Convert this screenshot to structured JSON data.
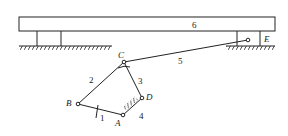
{
  "diagram": {
    "type": "planar linkage mechanism",
    "links": {
      "l1": "1",
      "l2": "2",
      "l3": "3",
      "l4": "4",
      "l5": "5",
      "l6": "6"
    },
    "joints": {
      "A": "A",
      "B": "B",
      "C": "C",
      "D": "D",
      "E": "E"
    },
    "colors": {
      "line": "#222222",
      "background": "#ffffff"
    }
  }
}
